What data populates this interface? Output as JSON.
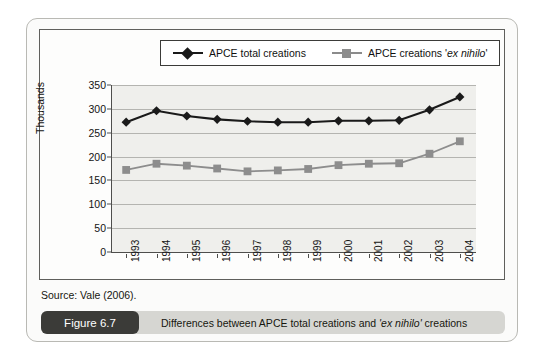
{
  "source_note": "Source: Vale (2006).",
  "caption": {
    "badge": "Figure 6.7",
    "text_before": "Differences between APCE total creations and ",
    "text_em": "'ex nihilo'",
    "text_after": " creations",
    "full": "Differences between APCE total creations and 'ex nihilo' creations"
  },
  "legend": {
    "items": [
      {
        "label_plain": "APCE total creations",
        "label_pre": "APCE total creations",
        "label_em": "",
        "label_post": "",
        "marker": "diamond",
        "color": "#1a1a1a"
      },
      {
        "label_plain": "APCE creations 'ex nihilo'",
        "label_pre": "APCE creations '",
        "label_em": "ex nihilo",
        "label_post": "'",
        "marker": "square",
        "color": "#8d8d8d"
      }
    ]
  },
  "chart_data": {
    "type": "line",
    "title": "",
    "xlabel": "",
    "ylabel": "Thousands",
    "ylim": [
      0,
      350
    ],
    "yticks": [
      0,
      50,
      100,
      150,
      200,
      250,
      300,
      350
    ],
    "ytick_labels": [
      "0",
      "50",
      "100",
      "150",
      "200",
      "250",
      "300",
      "350"
    ],
    "grid": true,
    "legend_position": "top",
    "categories": [
      "1993",
      "1994",
      "1995",
      "1996",
      "1997",
      "1998",
      "1999",
      "2000",
      "2001",
      "2002",
      "2003",
      "2004"
    ],
    "series": [
      {
        "name": "APCE total creations",
        "marker": "diamond",
        "color": "#1a1a1a",
        "values": [
          272,
          296,
          285,
          278,
          274,
          272,
          272,
          275,
          275,
          276,
          298,
          325
        ]
      },
      {
        "name": "APCE creations 'ex nihilo'",
        "marker": "square",
        "color": "#8d8d8d",
        "values": [
          172,
          185,
          181,
          175,
          169,
          171,
          174,
          182,
          185,
          186,
          206,
          232
        ]
      }
    ]
  }
}
